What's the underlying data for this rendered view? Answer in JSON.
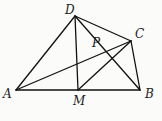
{
  "figure": {
    "points": {
      "A": {
        "x": 16,
        "y": 90,
        "label": "A",
        "lx": 3,
        "ly": 98
      },
      "B": {
        "x": 140,
        "y": 90,
        "label": "B",
        "lx": 145,
        "ly": 98
      },
      "C": {
        "x": 131,
        "y": 41,
        "label": "C",
        "lx": 135,
        "ly": 38
      },
      "D": {
        "x": 75,
        "y": 16,
        "label": "D",
        "lx": 65,
        "ly": 14
      },
      "M": {
        "x": 78,
        "y": 90,
        "label": "M",
        "lx": 73,
        "ly": 105
      },
      "P": {
        "x": 108,
        "y": 45,
        "label": "P",
        "lx": 92,
        "ly": 47
      }
    },
    "segments": [
      [
        "A",
        "B"
      ],
      [
        "A",
        "D"
      ],
      [
        "D",
        "C"
      ],
      [
        "C",
        "B"
      ],
      [
        "D",
        "M"
      ],
      [
        "A",
        "C"
      ],
      [
        "D",
        "B"
      ],
      [
        "M",
        "C"
      ]
    ]
  }
}
